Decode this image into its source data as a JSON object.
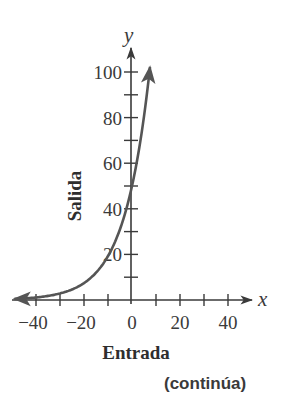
{
  "chart_data": {
    "type": "line",
    "title": "",
    "xlabel": "Entrada",
    "ylabel": "Salida",
    "x_axis_letter": "x",
    "y_axis_letter": "y",
    "xlim": [
      -45,
      48
    ],
    "ylim": [
      0,
      115
    ],
    "x_ticks": [
      -40,
      -30,
      -20,
      -10,
      0,
      10,
      20,
      30,
      40
    ],
    "x_tick_labels": [
      "−40",
      "−20",
      "0",
      "20",
      "40"
    ],
    "x_tick_label_values": [
      -40,
      -20,
      0,
      20,
      40
    ],
    "y_ticks": [
      10,
      20,
      30,
      40,
      50,
      60,
      70,
      80,
      90,
      100
    ],
    "y_tick_labels": [
      "20",
      "40",
      "60",
      "80",
      "100"
    ],
    "y_tick_label_values": [
      20,
      40,
      60,
      80,
      100
    ],
    "grid": false,
    "legend": null,
    "series": [
      {
        "name": "f(x) = 50·1.1^x",
        "function": "50*1.1^x",
        "color": "#555555",
        "arrows": "both",
        "x": [
          -50,
          -40,
          -30,
          -20,
          -10,
          0,
          5,
          7.5
        ],
        "values": [
          0.4,
          1.1,
          2.9,
          7.4,
          19.3,
          50,
          80.5,
          102
        ]
      }
    ]
  },
  "footer": {
    "continues_label": "(continúa)"
  }
}
